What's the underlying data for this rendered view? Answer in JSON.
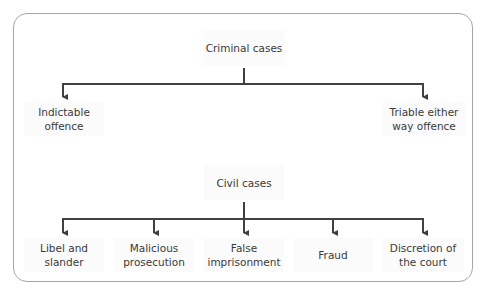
{
  "diagram": {
    "type": "tree",
    "groups": [
      {
        "root": "Criminal cases",
        "children": [
          "Indictable offence",
          "Triable either way offence"
        ]
      },
      {
        "root": "Civil cases",
        "children": [
          "Libel and slander",
          "Malicious prosecution",
          "False imprisonment",
          "Fraud",
          "Discretion of the court"
        ]
      }
    ]
  },
  "criminal": {
    "root": "Criminal cases",
    "children": [
      {
        "line1": "Indictable",
        "line2": "offence"
      },
      {
        "line1": "Triable either",
        "line2": "way offence"
      }
    ]
  },
  "civil": {
    "root": "Civil cases",
    "children": [
      {
        "line1": "Libel and",
        "line2": "slander"
      },
      {
        "line1": "Malicious",
        "line2": "prosecution"
      },
      {
        "line1": "False",
        "line2": "imprisonment"
      },
      {
        "line1": "Fraud",
        "line2": ""
      },
      {
        "line1": "Discretion of",
        "line2": "the court"
      }
    ]
  },
  "colors": {
    "line": "#404040",
    "frame": "#a6a6a6",
    "text": "#3a3a3a"
  }
}
